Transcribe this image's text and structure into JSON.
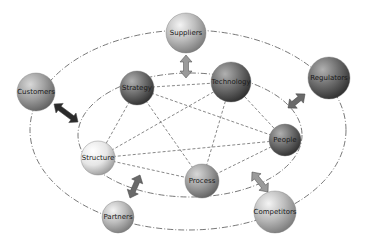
{
  "diagram": {
    "type": "network",
    "nodes": [
      {
        "id": "suppliers",
        "label": "Suppliers",
        "x": 186,
        "y": 33,
        "r": 20,
        "shade": "light"
      },
      {
        "id": "strategy",
        "label": "Strategy",
        "x": 137,
        "y": 88,
        "r": 17,
        "shade": "dark"
      },
      {
        "id": "technology",
        "label": "Technology",
        "x": 231,
        "y": 82,
        "r": 20,
        "shade": "dark"
      },
      {
        "id": "regulators",
        "label": "Regulators",
        "x": 329,
        "y": 78,
        "r": 21,
        "shade": "dark"
      },
      {
        "id": "customers",
        "label": "Customers",
        "x": 36,
        "y": 92,
        "r": 19,
        "shade": "medium"
      },
      {
        "id": "people",
        "label": "People",
        "x": 285,
        "y": 140,
        "r": 16,
        "shade": "dark"
      },
      {
        "id": "structure",
        "label": "Structure",
        "x": 98,
        "y": 158,
        "r": 17,
        "shade": "white"
      },
      {
        "id": "process",
        "label": "Process",
        "x": 202,
        "y": 181,
        "r": 17,
        "shade": "medium"
      },
      {
        "id": "partners",
        "label": "Partners",
        "x": 118,
        "y": 217,
        "r": 16,
        "shade": "light"
      },
      {
        "id": "competitors",
        "label": "Competitors",
        "x": 275,
        "y": 212,
        "r": 21,
        "shade": "light"
      }
    ],
    "inner_links": [
      [
        "strategy",
        "technology"
      ],
      [
        "strategy",
        "people"
      ],
      [
        "strategy",
        "structure"
      ],
      [
        "strategy",
        "process"
      ],
      [
        "technology",
        "people"
      ],
      [
        "technology",
        "structure"
      ],
      [
        "technology",
        "process"
      ],
      [
        "people",
        "structure"
      ],
      [
        "people",
        "process"
      ],
      [
        "structure",
        "process"
      ]
    ],
    "arrows": [
      {
        "from": "suppliers",
        "to": "strategy_technology_gap",
        "x1": 186,
        "y1": 55,
        "x2": 186,
        "y2": 78,
        "style": "light"
      },
      {
        "from": "customers",
        "to": "inner_ring",
        "x1": 54,
        "y1": 104,
        "x2": 78,
        "y2": 122,
        "style": "dark"
      },
      {
        "from": "regulators",
        "to": "inner_ring",
        "x1": 305,
        "y1": 94,
        "x2": 288,
        "y2": 108,
        "style": "medium"
      },
      {
        "from": "partners",
        "to": "inner_ring",
        "x1": 130,
        "y1": 198,
        "x2": 140,
        "y2": 175,
        "style": "medium"
      },
      {
        "from": "competitors",
        "to": "inner_ring",
        "x1": 268,
        "y1": 192,
        "x2": 252,
        "y2": 172,
        "style": "light"
      }
    ],
    "outer_ellipse": {
      "cx": 188,
      "cy": 130,
      "rx": 158,
      "ry": 100
    },
    "inner_ellipse": {
      "cx": 190,
      "cy": 135,
      "rx": 112,
      "ry": 62
    }
  }
}
